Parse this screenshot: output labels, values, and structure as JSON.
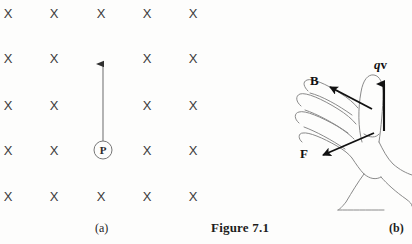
{
  "figure": {
    "caption": "Figure 7.1",
    "panel_a_label": "(a)",
    "panel_b_label": "(b)"
  },
  "panel_a": {
    "field_symbol": "X",
    "field_symbol_meaning": "magnetic-field-into-page",
    "grid": {
      "columns": 5,
      "rows": 5,
      "x_positions": [
        8,
        54,
        101,
        147,
        193
      ],
      "y_positions": [
        13,
        58,
        105,
        150,
        196
      ]
    },
    "x_marks": [
      {
        "x": 8,
        "y": 13,
        "label": "X"
      },
      {
        "x": 54,
        "y": 13,
        "label": "X"
      },
      {
        "x": 101,
        "y": 13,
        "label": "X"
      },
      {
        "x": 147,
        "y": 13,
        "label": "X"
      },
      {
        "x": 193,
        "y": 13,
        "label": "X"
      },
      {
        "x": 8,
        "y": 58,
        "label": "X"
      },
      {
        "x": 54,
        "y": 58,
        "label": "X"
      },
      {
        "x": 147,
        "y": 58,
        "label": "X"
      },
      {
        "x": 193,
        "y": 58,
        "label": "X"
      },
      {
        "x": 8,
        "y": 105,
        "label": "X"
      },
      {
        "x": 54,
        "y": 105,
        "label": "X"
      },
      {
        "x": 147,
        "y": 105,
        "label": "X"
      },
      {
        "x": 193,
        "y": 105,
        "label": "X"
      },
      {
        "x": 8,
        "y": 150,
        "label": "X"
      },
      {
        "x": 54,
        "y": 150,
        "label": "X"
      },
      {
        "x": 147,
        "y": 150,
        "label": "X"
      },
      {
        "x": 193,
        "y": 150,
        "label": "X"
      },
      {
        "x": 8,
        "y": 196,
        "label": "X"
      },
      {
        "x": 54,
        "y": 196,
        "label": "X"
      },
      {
        "x": 101,
        "y": 196,
        "label": "X"
      },
      {
        "x": 147,
        "y": 196,
        "label": "X"
      },
      {
        "x": 193,
        "y": 196,
        "label": "X"
      }
    ],
    "point": {
      "label": "P",
      "cx": 103,
      "cy": 150,
      "r": 9
    },
    "velocity_arrow": {
      "x": 103,
      "y_start": 141,
      "y_end": 57,
      "direction": "up"
    }
  },
  "panel_b": {
    "labels": {
      "magnetic_field": "B",
      "force": "F",
      "charge_velocity_q": "q",
      "charge_velocity_v": "v"
    },
    "arrows": [
      {
        "name": "B-arrow",
        "from": [
          82,
          62
        ],
        "to": [
          40,
          40
        ],
        "label": "B"
      },
      {
        "name": "F-arrow",
        "from": [
          85,
          87
        ],
        "to": [
          32,
          109
        ],
        "label": "F"
      },
      {
        "name": "qv-arrow",
        "from": [
          96,
          84
        ],
        "to": [
          96,
          32
        ],
        "label": "qv"
      }
    ]
  },
  "colors": {
    "background": "#fdfdfc",
    "ink": "#1d1d1d",
    "line": "#6f6f6f",
    "x_mark": "#3a3a3a"
  }
}
